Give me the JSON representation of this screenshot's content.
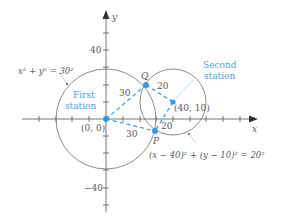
{
  "colors": {
    "axis": "#555555",
    "circle": "#707070",
    "accent": "#3a9ad9",
    "accent_text": "#4aa3df",
    "text": "#5a5a5a"
  },
  "axes": {
    "x_label": "x",
    "y_label": "y",
    "y_tick_top_label": "40",
    "y_tick_bottom_label": "−40",
    "tick_spacing_units": 10,
    "x_range": [
      -50,
      90
    ],
    "y_range": [
      -55,
      60
    ]
  },
  "circles": [
    {
      "name": "first",
      "center": [
        0,
        0
      ],
      "radius": 30,
      "equation": "x² + y² = 30²",
      "station_label_line1": "First",
      "station_label_line2": "station",
      "center_label": "(0, 0)"
    },
    {
      "name": "second",
      "center": [
        40,
        10
      ],
      "radius": 20,
      "equation": "(x − 40)² + (y − 10)² = 20²",
      "station_label_line1": "Second",
      "station_label_line2": "station",
      "center_label": "(40, 10)"
    }
  ],
  "points": {
    "Q": {
      "label": "Q"
    },
    "P": {
      "label": "P"
    }
  },
  "distances": {
    "origin_to_Q": "30",
    "origin_to_P": "30",
    "second_to_Q": "20",
    "second_to_P": "20"
  }
}
